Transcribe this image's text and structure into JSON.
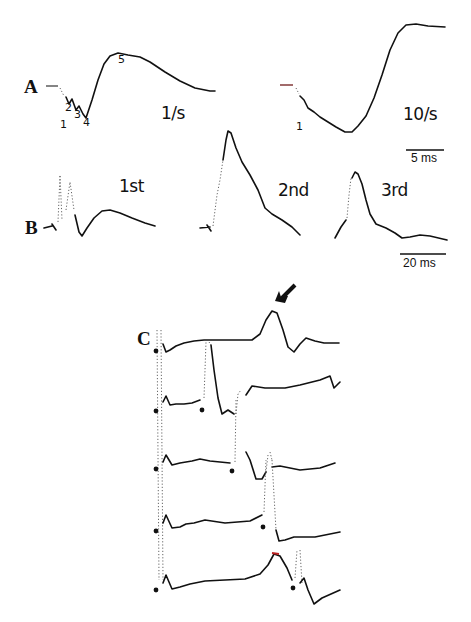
{
  "figure": {
    "panels": {
      "A": {
        "label": "A",
        "traces": [
          {
            "condition": "1/s",
            "peak_labels": [
              "1",
              "2",
              "3",
              "4",
              "5"
            ]
          },
          {
            "condition": "10/s",
            "peak_labels": [
              "1"
            ]
          }
        ],
        "scale_bar": "5 ms"
      },
      "B": {
        "label": "B",
        "traces": [
          {
            "condition": "1st"
          },
          {
            "condition": "2nd"
          },
          {
            "condition": "3rd"
          }
        ],
        "scale_bar": "20 ms"
      },
      "C": {
        "label": "C",
        "trace_count": 5,
        "annotation": "arrow pointing to late peak in top trace"
      }
    }
  }
}
